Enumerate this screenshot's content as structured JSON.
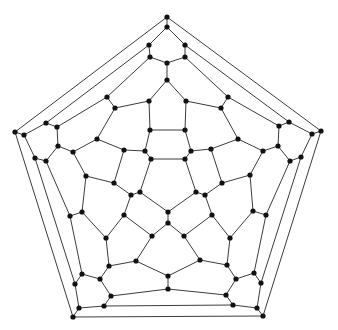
{
  "diagram": {
    "type": "planar-graph",
    "caption_partially_visible": true,
    "style": {
      "edge_color": "#3c3c3c",
      "node_color": "#111111",
      "background": "#ffffff",
      "node_radius": 2.6
    },
    "nodes": [
      [
        167,
        17
      ],
      [
        167,
        27
      ],
      [
        149,
        45
      ],
      [
        185,
        45
      ],
      [
        150,
        57
      ],
      [
        185,
        57
      ],
      [
        167,
        63
      ],
      [
        167,
        80
      ],
      [
        107,
        97
      ],
      [
        115,
        108
      ],
      [
        149,
        101
      ],
      [
        186,
        101
      ],
      [
        228,
        97
      ],
      [
        221,
        108
      ],
      [
        150,
        130
      ],
      [
        185,
        130
      ],
      [
        15,
        132
      ],
      [
        24,
        135
      ],
      [
        46,
        123
      ],
      [
        57,
        127
      ],
      [
        58,
        146
      ],
      [
        35,
        158
      ],
      [
        46,
        161
      ],
      [
        73,
        152
      ],
      [
        97,
        139
      ],
      [
        124,
        150
      ],
      [
        145,
        151
      ],
      [
        151,
        159
      ],
      [
        185,
        159
      ],
      [
        191,
        151
      ],
      [
        211,
        149
      ],
      [
        238,
        139
      ],
      [
        86,
        176
      ],
      [
        114,
        183
      ],
      [
        131,
        195
      ],
      [
        140,
        192
      ],
      [
        168,
        212
      ],
      [
        196,
        192
      ],
      [
        205,
        195
      ],
      [
        222,
        183
      ],
      [
        82,
        212
      ],
      [
        70,
        216
      ],
      [
        124,
        215
      ],
      [
        168,
        223
      ],
      [
        152,
        236
      ],
      [
        184,
        236
      ],
      [
        212,
        215
      ],
      [
        106,
        238
      ],
      [
        109,
        266
      ],
      [
        136,
        261
      ],
      [
        168,
        276
      ],
      [
        200,
        260
      ],
      [
        227,
        265
      ],
      [
        230,
        238
      ],
      [
        82,
        274
      ],
      [
        75,
        284
      ],
      [
        100,
        279
      ],
      [
        111,
        296
      ],
      [
        168,
        289
      ],
      [
        226,
        295
      ],
      [
        236,
        279
      ],
      [
        254,
        273
      ],
      [
        261,
        283
      ],
      [
        104,
        306
      ],
      [
        233,
        305
      ],
      [
        79,
        308
      ],
      [
        257,
        308
      ],
      [
        73,
        317
      ],
      [
        263,
        316
      ],
      [
        321,
        131
      ],
      [
        312,
        134
      ],
      [
        289,
        122
      ],
      [
        279,
        126
      ],
      [
        278,
        146
      ],
      [
        290,
        161
      ],
      [
        301,
        157
      ],
      [
        263,
        151
      ],
      [
        250,
        175
      ],
      [
        253,
        211
      ],
      [
        266,
        215
      ]
    ],
    "edges": [
      [
        0,
        1
      ],
      [
        0,
        16
      ],
      [
        0,
        69
      ],
      [
        1,
        2
      ],
      [
        1,
        3
      ],
      [
        2,
        4
      ],
      [
        3,
        5
      ],
      [
        4,
        6
      ],
      [
        5,
        6
      ],
      [
        6,
        7
      ],
      [
        2,
        18
      ],
      [
        3,
        71
      ],
      [
        4,
        8
      ],
      [
        5,
        12
      ],
      [
        7,
        10
      ],
      [
        7,
        11
      ],
      [
        8,
        9
      ],
      [
        8,
        19
      ],
      [
        12,
        13
      ],
      [
        12,
        72
      ],
      [
        10,
        9
      ],
      [
        11,
        13
      ],
      [
        10,
        14
      ],
      [
        11,
        15
      ],
      [
        14,
        15
      ],
      [
        14,
        26
      ],
      [
        15,
        29
      ],
      [
        9,
        24
      ],
      [
        13,
        31
      ],
      [
        16,
        17
      ],
      [
        17,
        18
      ],
      [
        18,
        19
      ],
      [
        19,
        20
      ],
      [
        20,
        22
      ],
      [
        22,
        21
      ],
      [
        21,
        17
      ],
      [
        20,
        23
      ],
      [
        23,
        24
      ],
      [
        24,
        25
      ],
      [
        23,
        32
      ],
      [
        32,
        33
      ],
      [
        32,
        40
      ],
      [
        25,
        26
      ],
      [
        25,
        33
      ],
      [
        26,
        27
      ],
      [
        27,
        28
      ],
      [
        28,
        29
      ],
      [
        29,
        30
      ],
      [
        27,
        35
      ],
      [
        28,
        37
      ],
      [
        33,
        34
      ],
      [
        34,
        35
      ],
      [
        35,
        36
      ],
      [
        37,
        36
      ],
      [
        37,
        38
      ],
      [
        38,
        39
      ],
      [
        36,
        43
      ],
      [
        34,
        42
      ],
      [
        38,
        46
      ],
      [
        42,
        47
      ],
      [
        42,
        44
      ],
      [
        43,
        44
      ],
      [
        43,
        45
      ],
      [
        45,
        46
      ],
      [
        46,
        53
      ],
      [
        40,
        41
      ],
      [
        40,
        47
      ],
      [
        47,
        48
      ],
      [
        44,
        49
      ],
      [
        48,
        49
      ],
      [
        49,
        50
      ],
      [
        50,
        51
      ],
      [
        50,
        58
      ],
      [
        51,
        45
      ],
      [
        51,
        52
      ],
      [
        52,
        53
      ],
      [
        53,
        78
      ],
      [
        52,
        60
      ],
      [
        48,
        56
      ],
      [
        56,
        54
      ],
      [
        56,
        57
      ],
      [
        57,
        58
      ],
      [
        58,
        59
      ],
      [
        59,
        60
      ],
      [
        60,
        61
      ],
      [
        59,
        64
      ],
      [
        57,
        63
      ],
      [
        63,
        64
      ],
      [
        63,
        65
      ],
      [
        64,
        66
      ],
      [
        65,
        67
      ],
      [
        66,
        68
      ],
      [
        67,
        68
      ],
      [
        65,
        55
      ],
      [
        55,
        54
      ],
      [
        55,
        21
      ],
      [
        54,
        41
      ],
      [
        41,
        22
      ],
      [
        69,
        70
      ],
      [
        70,
        71
      ],
      [
        71,
        72
      ],
      [
        72,
        73
      ],
      [
        73,
        74
      ],
      [
        74,
        75
      ],
      [
        75,
        70
      ],
      [
        73,
        76
      ],
      [
        76,
        31
      ],
      [
        31,
        30
      ],
      [
        76,
        77
      ],
      [
        77,
        39
      ],
      [
        77,
        78
      ],
      [
        30,
        39
      ],
      [
        78,
        79
      ],
      [
        79,
        74
      ],
      [
        79,
        61
      ],
      [
        61,
        62
      ],
      [
        62,
        75
      ],
      [
        62,
        66
      ],
      [
        69,
        68
      ],
      [
        16,
        67
      ]
    ]
  }
}
